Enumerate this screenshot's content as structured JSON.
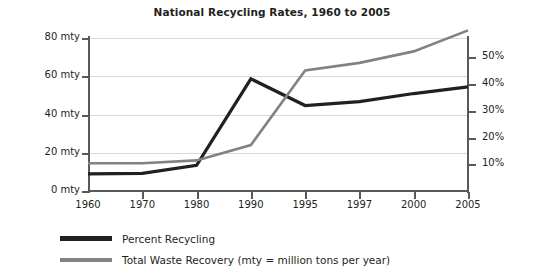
{
  "chart_data": {
    "type": "line",
    "title": "National Recycling Rates, 1960 to 2005",
    "xlabel": "",
    "ylabel": "",
    "categories": [
      "1960",
      "1970",
      "1980",
      "1990",
      "1995",
      "1997",
      "2000",
      "2005"
    ],
    "grid": true,
    "legend_position": "bottom-left",
    "axes": {
      "left": {
        "label": "",
        "ticks": [
          "0 mty",
          "20 mty",
          "40 mty",
          "60 mty",
          "80 mty"
        ],
        "tick_values": [
          0,
          20,
          40,
          60,
          80
        ],
        "ylim": [
          0,
          80
        ],
        "unit": "mty"
      },
      "right": {
        "label": "",
        "ticks": [
          "10%",
          "20%",
          "30%",
          "40%",
          "50%"
        ],
        "tick_values": [
          10,
          20,
          30,
          40,
          50
        ],
        "ylim": [
          0,
          57.3
        ],
        "unit": "%"
      }
    },
    "series": [
      {
        "name": "Percent Recycling",
        "axis": "right",
        "color": "#231f20",
        "values": [
          6.4,
          6.6,
          9.6,
          42.0,
          32.0,
          33.5,
          36.5,
          39.0
        ]
      },
      {
        "name": "Total Waste Recovery (mty = million tons per year)",
        "axis": "left",
        "color": "#808284",
        "values": [
          14.5,
          14.5,
          16.0,
          24.0,
          63.0,
          67.0,
          73.0,
          84.0
        ]
      }
    ],
    "legend": [
      {
        "label": "Percent Recycling",
        "color": "#231f20"
      },
      {
        "label": "Total Waste Recovery (mty = million tons per year)",
        "color": "#808284"
      }
    ]
  }
}
